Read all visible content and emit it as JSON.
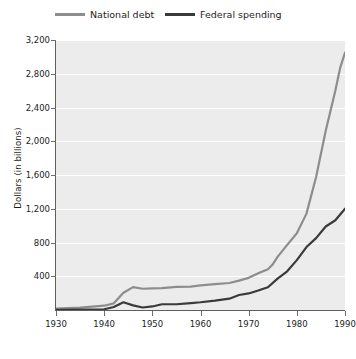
{
  "chart_data": {
    "type": "line",
    "title": "",
    "xlabel": "",
    "ylabel": "Dollars (in billions)",
    "xlim": [
      1930,
      1990
    ],
    "ylim": [
      0,
      3200
    ],
    "xticks": [
      1930,
      1940,
      1950,
      1960,
      1970,
      1980,
      1990
    ],
    "xtick_labels": [
      "1930",
      "1940",
      "1950",
      "1960",
      "1970",
      "1980",
      "1990"
    ],
    "yticks": [
      400,
      800,
      1200,
      1600,
      2000,
      2400,
      2800,
      3200
    ],
    "ytick_labels": [
      "400",
      "800",
      "1,200",
      "1,600",
      "2,000",
      "2,400",
      "2,800",
      "3,200"
    ],
    "grid": "horizontal",
    "legend_position": "top",
    "plot_background": "#ececed",
    "series": [
      {
        "name": "National debt",
        "color": "#8d8d8d",
        "x": [
          1930,
          1935,
          1940,
          1942,
          1944,
          1946,
          1948,
          1950,
          1952,
          1955,
          1958,
          1960,
          1963,
          1966,
          1968,
          1970,
          1972,
          1974,
          1975,
          1976,
          1978,
          1980,
          1982,
          1984,
          1986,
          1988,
          1989,
          1990
        ],
        "values": [
          16,
          29,
          51,
          79,
          204,
          271,
          252,
          257,
          259,
          274,
          276,
          291,
          306,
          320,
          348,
          381,
          436,
          484,
          541,
          629,
          772,
          909,
          1142,
          1577,
          2125,
          2602,
          2870,
          3050
        ]
      },
      {
        "name": "Federal spending",
        "color": "#3a3a3a",
        "x": [
          1930,
          1935,
          1940,
          1942,
          1944,
          1946,
          1948,
          1950,
          1952,
          1955,
          1958,
          1960,
          1963,
          1966,
          1968,
          1970,
          1972,
          1974,
          1976,
          1978,
          1980,
          1982,
          1984,
          1986,
          1988,
          1990
        ],
        "values": [
          3,
          6,
          9,
          35,
          91,
          55,
          30,
          42,
          68,
          68,
          82,
          92,
          111,
          134,
          178,
          196,
          231,
          269,
          372,
          459,
          591,
          746,
          852,
          990,
          1064,
          1200
        ]
      }
    ]
  },
  "legend": {
    "items": [
      {
        "label": "National debt",
        "color": "#8d8d8d"
      },
      {
        "label": "Federal spending",
        "color": "#3a3a3a"
      }
    ]
  }
}
